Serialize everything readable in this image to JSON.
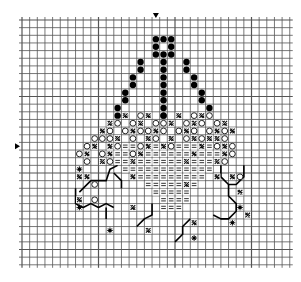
{
  "title": "Cross-stitch pattern chart",
  "grid": {
    "origin_x": 22,
    "origin_y": 20,
    "cell": 7.65,
    "cols": 35,
    "rows": 32,
    "line_color": "#555555",
    "bold_every": 10
  },
  "markers": {
    "top_center": {
      "col": 17.5,
      "symbol": "▼"
    },
    "left_center": {
      "row": 16.5,
      "symbol": "▶"
    }
  },
  "legend_symbols": {
    "filled_dot": "●",
    "open_circle": "○",
    "hatch": "✕",
    "equals": "=",
    "star": "✱"
  },
  "chart_data": {
    "type": "pattern-grid",
    "filled_dot": [
      [
        17,
        2
      ],
      [
        18,
        2
      ],
      [
        19,
        2
      ],
      [
        17,
        3
      ],
      [
        19,
        3
      ],
      [
        17,
        4
      ],
      [
        18,
        4
      ],
      [
        19,
        4
      ],
      [
        15,
        5
      ],
      [
        18,
        5
      ],
      [
        21,
        5
      ],
      [
        15,
        6
      ],
      [
        18,
        6
      ],
      [
        21,
        6
      ],
      [
        14,
        7
      ],
      [
        18,
        7
      ],
      [
        22,
        7
      ],
      [
        14,
        8
      ],
      [
        18,
        8
      ],
      [
        22,
        8
      ],
      [
        13,
        9
      ],
      [
        18,
        9
      ],
      [
        23,
        9
      ],
      [
        13,
        10
      ],
      [
        18,
        10
      ],
      [
        23,
        10
      ],
      [
        12,
        11
      ],
      [
        18,
        11
      ],
      [
        24,
        11
      ],
      [
        12,
        12
      ],
      [
        18,
        12
      ]
    ],
    "open_circle": [
      [
        13,
        12
      ],
      [
        15,
        12
      ],
      [
        18,
        12
      ],
      [
        22,
        12
      ],
      [
        24,
        12
      ],
      [
        12,
        13
      ],
      [
        14,
        13
      ],
      [
        17,
        13
      ],
      [
        18,
        13
      ],
      [
        21,
        13
      ],
      [
        23,
        13
      ],
      [
        25,
        13
      ],
      [
        11,
        14
      ],
      [
        13,
        14
      ],
      [
        15,
        14
      ],
      [
        16,
        14
      ],
      [
        18,
        14
      ],
      [
        20,
        14
      ],
      [
        22,
        14
      ],
      [
        24,
        14
      ],
      [
        26,
        14
      ],
      [
        9,
        15
      ],
      [
        10,
        15
      ],
      [
        11,
        15
      ],
      [
        14,
        15
      ],
      [
        17,
        15
      ],
      [
        21,
        15
      ],
      [
        23,
        15
      ],
      [
        26,
        15
      ],
      [
        8,
        16
      ],
      [
        12,
        16
      ],
      [
        15,
        16
      ],
      [
        19,
        16
      ],
      [
        25,
        16
      ],
      [
        27,
        16
      ],
      [
        7,
        17
      ],
      [
        10,
        17
      ],
      [
        14,
        17
      ],
      [
        27,
        17
      ],
      [
        8,
        18
      ],
      [
        11,
        18
      ],
      [
        26,
        18
      ],
      [
        9,
        21
      ],
      [
        28,
        20
      ],
      [
        9,
        23
      ]
    ],
    "hatch": [
      [
        13,
        12
      ],
      [
        16,
        12
      ],
      [
        20,
        12
      ],
      [
        23,
        12
      ],
      [
        11,
        13
      ],
      [
        15,
        13
      ],
      [
        19,
        13
      ],
      [
        22,
        13
      ],
      [
        26,
        13
      ],
      [
        10,
        14
      ],
      [
        14,
        14
      ],
      [
        17,
        14
      ],
      [
        21,
        14
      ],
      [
        25,
        14
      ],
      [
        27,
        14
      ],
      [
        12,
        15
      ],
      [
        16,
        15
      ],
      [
        19,
        15
      ],
      [
        22,
        15
      ],
      [
        24,
        15
      ],
      [
        25,
        15
      ],
      [
        9,
        16
      ],
      [
        11,
        16
      ],
      [
        16,
        16
      ],
      [
        18,
        16
      ],
      [
        23,
        16
      ],
      [
        26,
        16
      ],
      [
        8,
        17
      ],
      [
        11,
        17
      ],
      [
        15,
        17
      ],
      [
        22,
        17
      ],
      [
        26,
        17
      ],
      [
        10,
        18
      ],
      [
        14,
        18
      ],
      [
        21,
        18
      ],
      [
        25,
        18
      ],
      [
        7,
        20
      ],
      [
        8,
        20
      ],
      [
        14,
        20
      ],
      [
        25,
        20
      ],
      [
        27,
        20
      ],
      [
        21,
        21
      ],
      [
        28,
        22
      ],
      [
        7,
        23
      ],
      [
        14,
        24
      ],
      [
        16,
        27
      ],
      [
        22,
        26
      ],
      [
        29,
        25
      ]
    ],
    "equals": [
      [
        12,
        16
      ],
      [
        13,
        16
      ],
      [
        14,
        16
      ],
      [
        17,
        16
      ],
      [
        20,
        16
      ],
      [
        21,
        16
      ],
      [
        22,
        16
      ],
      [
        24,
        16
      ],
      [
        12,
        17
      ],
      [
        13,
        17
      ],
      [
        16,
        17
      ],
      [
        17,
        17
      ],
      [
        18,
        17
      ],
      [
        19,
        17
      ],
      [
        20,
        17
      ],
      [
        21,
        17
      ],
      [
        23,
        17
      ],
      [
        24,
        17
      ],
      [
        25,
        17
      ],
      [
        12,
        18
      ],
      [
        13,
        18
      ],
      [
        15,
        18
      ],
      [
        16,
        18
      ],
      [
        17,
        18
      ],
      [
        18,
        18
      ],
      [
        19,
        18
      ],
      [
        20,
        18
      ],
      [
        22,
        18
      ],
      [
        23,
        18
      ],
      [
        24,
        18
      ],
      [
        13,
        19
      ],
      [
        14,
        19
      ],
      [
        15,
        19
      ],
      [
        16,
        19
      ],
      [
        17,
        19
      ],
      [
        18,
        19
      ],
      [
        19,
        19
      ],
      [
        20,
        19
      ],
      [
        21,
        19
      ],
      [
        22,
        19
      ],
      [
        23,
        19
      ],
      [
        24,
        19
      ],
      [
        15,
        20
      ],
      [
        16,
        20
      ],
      [
        17,
        20
      ],
      [
        18,
        20
      ],
      [
        19,
        20
      ],
      [
        20,
        20
      ],
      [
        21,
        20
      ],
      [
        22,
        20
      ],
      [
        23,
        20
      ],
      [
        16,
        21
      ],
      [
        17,
        21
      ],
      [
        18,
        21
      ],
      [
        19,
        21
      ],
      [
        20,
        21
      ],
      [
        22,
        21
      ],
      [
        17,
        22
      ],
      [
        18,
        22
      ],
      [
        19,
        22
      ],
      [
        20,
        22
      ],
      [
        21,
        22
      ],
      [
        18,
        23
      ],
      [
        19,
        23
      ],
      [
        20,
        23
      ],
      [
        21,
        23
      ],
      [
        18,
        24
      ],
      [
        19,
        24
      ],
      [
        20,
        24
      ]
    ],
    "star": [
      [
        7,
        19
      ],
      [
        7,
        24
      ],
      [
        11,
        27
      ],
      [
        28,
        24
      ],
      [
        27,
        26
      ],
      [
        22,
        28
      ]
    ],
    "backstitch": [
      [
        [
          7.5,
          22.5
        ],
        [
          9,
          21
        ],
        [
          11,
          21
        ],
        [
          11.5,
          19.5
        ],
        [
          12.5,
          19
        ]
      ],
      [
        [
          7,
          22
        ],
        [
          7,
          24
        ],
        [
          8,
          24.5
        ],
        [
          9,
          24
        ],
        [
          10,
          24.5
        ],
        [
          11,
          24
        ],
        [
          12,
          24.5
        ]
      ],
      [
        [
          11,
          24.5
        ],
        [
          11,
          26
        ]
      ],
      [
        [
          26,
          19
        ],
        [
          26,
          20.5
        ],
        [
          27,
          21.5
        ],
        [
          28,
          21.5
        ],
        [
          29,
          20.5
        ],
        [
          29,
          19
        ]
      ],
      [
        [
          27,
          21.5
        ],
        [
          27,
          23
        ],
        [
          28,
          24
        ],
        [
          28,
          25
        ],
        [
          27,
          26
        ],
        [
          26,
          26
        ],
        [
          25,
          25.5
        ]
      ],
      [
        [
          17,
          24
        ],
        [
          17,
          25.5
        ],
        [
          16,
          26
        ],
        [
          15,
          27
        ]
      ],
      [
        [
          22,
          26
        ],
        [
          21,
          27
        ],
        [
          21,
          28
        ],
        [
          20,
          29
        ]
      ],
      [
        [
          12,
          20
        ],
        [
          13,
          21
        ],
        [
          13,
          22
        ]
      ]
    ]
  }
}
